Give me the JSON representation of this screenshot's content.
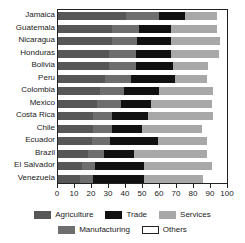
{
  "chart_data": {
    "type": "bar",
    "orientation": "horizontal",
    "stacked": true,
    "title": "",
    "xlabel": "",
    "ylabel": "",
    "xlim": [
      0,
      100
    ],
    "ylim": null,
    "grid": false,
    "legend_position": "bottom",
    "xticks": [
      0,
      10,
      20,
      30,
      40,
      50,
      60,
      70,
      80,
      90,
      100
    ],
    "xtick_labels": [
      "0",
      "10",
      "20",
      "30",
      "40",
      "50",
      "60",
      "70",
      "80",
      "90",
      "100"
    ],
    "categories": [
      "Jamaica",
      "Guatemala",
      "Nicaragua",
      "Honduras",
      "Bolivia",
      "Peru",
      "Colombia",
      "Mexico",
      "Costa Rica",
      "Chile",
      "Ecuador",
      "Brazil",
      "El Salvador",
      "Venezuela"
    ],
    "series": [
      {
        "name": "Agriculture",
        "color": "#575757",
        "values": [
          40,
          32,
          32,
          30,
          30,
          28,
          25,
          23,
          21,
          21,
          20,
          18,
          14,
          13
        ]
      },
      {
        "name": "Manufacturing",
        "color": "#6e6e6e",
        "values": [
          20,
          16,
          15,
          16,
          16,
          15,
          14,
          14,
          11,
          11,
          11,
          9,
          8,
          8
        ]
      },
      {
        "name": "Trade",
        "color": "#111111",
        "values": [
          15,
          19,
          20,
          21,
          22,
          26,
          21,
          18,
          21,
          18,
          28,
          18,
          29,
          30
        ]
      },
      {
        "name": "Services",
        "color": "#a8a8a8",
        "values": [
          19,
          27,
          29,
          28,
          21,
          19,
          32,
          36,
          39,
          35,
          29,
          43,
          40,
          35
        ]
      },
      {
        "name": "Others",
        "color": "#ffffff",
        "values": [
          6,
          6,
          4,
          5,
          11,
          12,
          8,
          9,
          8,
          15,
          12,
          12,
          9,
          14
        ]
      }
    ]
  },
  "legend": {
    "entries": [
      {
        "label": "Agriculture",
        "color": "#575757",
        "outline": false
      },
      {
        "label": "Trade",
        "color": "#111111",
        "outline": false
      },
      {
        "label": "Services",
        "color": "#a8a8a8",
        "outline": false
      },
      {
        "label": "Manufacturing",
        "color": "#6e6e6e",
        "outline": false
      },
      {
        "label": "Others",
        "color": "#ffffff",
        "outline": true
      }
    ]
  }
}
